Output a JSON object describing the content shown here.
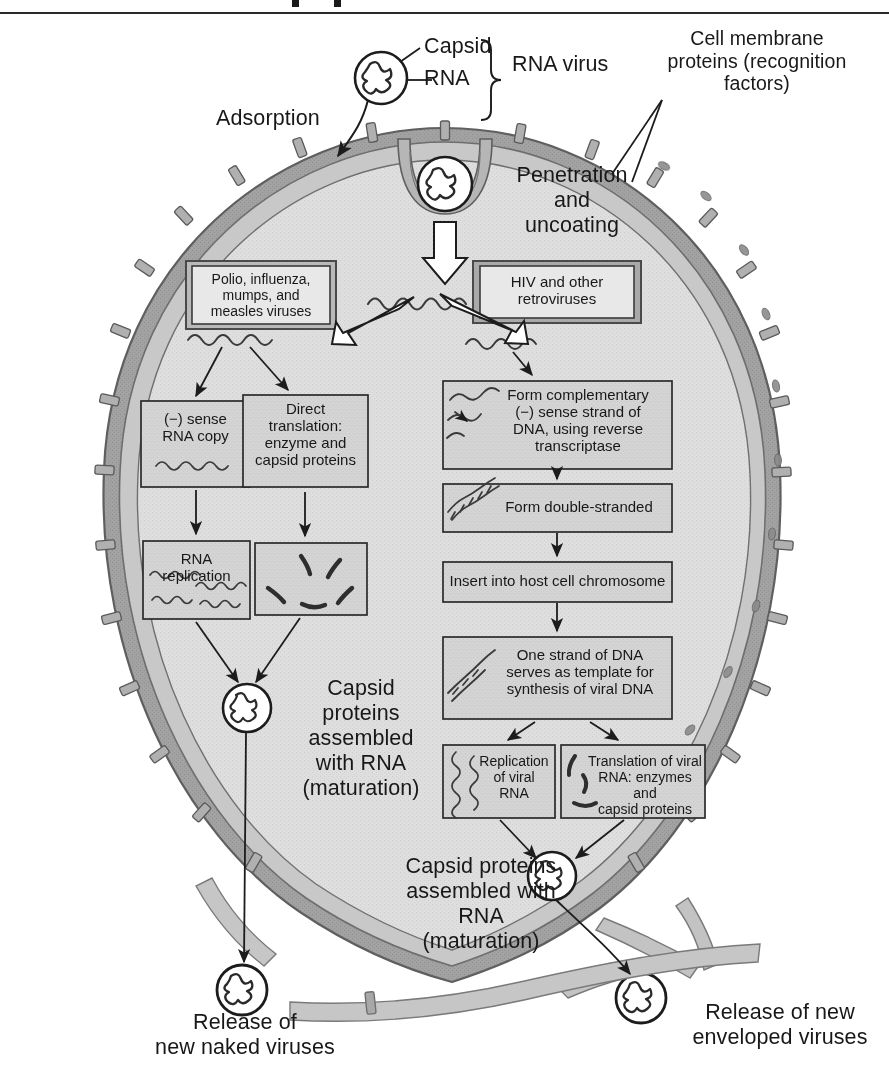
{
  "figure": {
    "colors": {
      "cytoplasm": "#dcdcdc",
      "membrane_light": "#c9c9c9",
      "membrane_dark": "#9a9a9a",
      "membrane_outline": "#6e6e6e",
      "box_fill": "#d2d2d2",
      "box_stroke": "#2b2b2b",
      "ink": "#17181a",
      "highlight_box_border": "#6a6a6a"
    }
  },
  "callouts": {
    "capsid": "Capsid",
    "rna": "RNA",
    "rna_virus": "RNA virus",
    "adsorption": "Adsorption",
    "penetration": "Penetration\nand\nuncoating",
    "membrane_proteins": "Cell membrane\nproteins (recognition\nfactors)"
  },
  "left_pathway": {
    "virus_types": "Polio, influenza,\nmumps, and\nmeasles viruses",
    "sense_copy": "(−) sense\nRNA copy",
    "direct_translation": "Direct\ntranslation:\nenzyme and\ncapsid proteins",
    "rna_replication": "RNA\nreplication",
    "maturation": "Capsid\nproteins\nassembled\nwith RNA\n(maturation)",
    "release": "Release of\nnew naked viruses"
  },
  "right_pathway": {
    "virus_types": "HIV and other\nretroviruses",
    "reverse_transcription": "Form complementary\n(−) sense strand of\nDNA, using reverse\ntranscriptase",
    "double_stranded": "Form double-stranded",
    "insert_chromosome": "Insert into host cell chromosome",
    "template": "One strand of DNA\nserves as template for\nsynthesis of viral DNA",
    "replication_viral_rna": "Replication\nof viral\nRNA",
    "translation_viral_rna": "Translation of viral\nRNA: enzymes and\ncapsid proteins",
    "maturation": "Capsid proteins\nassembled with\nRNA\n(maturation)",
    "release": "Release of new\nenveloped viruses"
  },
  "icons": {
    "virion": "virion-icon",
    "rna_strand": "rna-strand-icon",
    "dna_helix": "dna-helix-icon",
    "protein_arc": "protein-arc-icon",
    "membrane_protein": "membrane-protein-stud-icon",
    "block_arrow": "block-arrow-icon",
    "arrow": "arrow-icon",
    "brace": "curly-brace-icon"
  }
}
